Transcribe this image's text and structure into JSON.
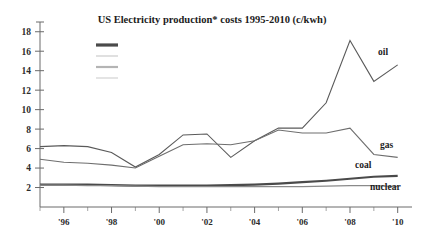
{
  "chart_data": {
    "type": "line",
    "title": "US Electricity production* costs  1995-2010 (c/kwh)",
    "xlabel": "",
    "ylabel": "",
    "ylim": [
      0,
      19
    ],
    "xlim": [
      1995,
      2010.6
    ],
    "grid": false,
    "legend_position": "top-left-inside",
    "legend_entries": [
      "",
      "",
      "",
      ""
    ],
    "yticks": [
      2,
      4,
      6,
      8,
      10,
      12,
      14,
      16,
      18
    ],
    "ytick_labels": [
      "2",
      "4",
      "6",
      "8",
      "10",
      "12",
      "14",
      "16",
      "18"
    ],
    "xticks": [
      1996,
      1998,
      2000,
      2002,
      2004,
      2006,
      2008,
      2010
    ],
    "xtick_labels": [
      "'96",
      "'98",
      "'00",
      "'02",
      "'04",
      "'06",
      "'08",
      "'10"
    ],
    "x": [
      1995,
      1996,
      1997,
      1998,
      1999,
      2000,
      2001,
      2002,
      2003,
      2004,
      2005,
      2006,
      2007,
      2008,
      2009,
      2010
    ],
    "series": [
      {
        "name": "oil",
        "label": "oil",
        "color": "#5a5a5a",
        "values": [
          6.2,
          6.3,
          6.2,
          5.6,
          4.1,
          5.4,
          7.4,
          7.5,
          5.1,
          6.8,
          8.1,
          8.1,
          10.7,
          17.1,
          12.9,
          14.6
        ]
      },
      {
        "name": "gas",
        "label": "gas",
        "color": "#6e6e6e",
        "values": [
          4.9,
          4.6,
          4.5,
          4.3,
          4.0,
          5.2,
          6.4,
          6.5,
          6.4,
          6.8,
          7.9,
          7.6,
          7.6,
          8.1,
          5.4,
          5.1
        ]
      },
      {
        "name": "coal",
        "label": "coal",
        "color": "#4a4a4a",
        "values": [
          2.3,
          2.3,
          2.3,
          2.25,
          2.2,
          2.2,
          2.2,
          2.2,
          2.25,
          2.3,
          2.4,
          2.55,
          2.7,
          2.9,
          3.1,
          3.2
        ]
      },
      {
        "name": "nuclear",
        "label": "nuclear",
        "color": "#8a8a8a",
        "values": [
          2.25,
          2.25,
          2.2,
          2.2,
          2.15,
          2.1,
          2.1,
          2.1,
          2.1,
          2.1,
          2.1,
          2.1,
          2.15,
          2.2,
          2.2,
          2.1
        ]
      }
    ]
  }
}
